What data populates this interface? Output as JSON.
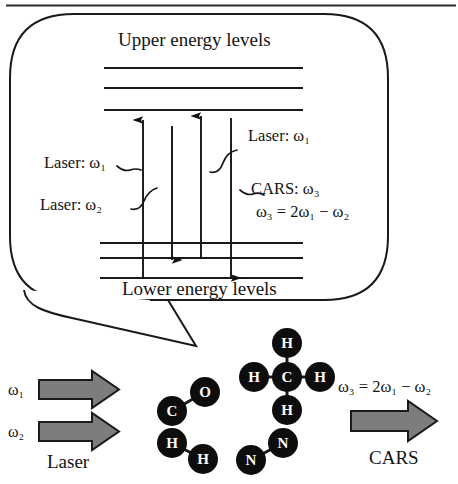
{
  "figure": {
    "bubble": {
      "heading": "Upper energy levels",
      "caption": "Lower energy levels",
      "annotations": {
        "laser_w1_left": "Laser: ω₁",
        "laser_w2_left": "Laser: ω₂",
        "laser_w1_right": "Laser: ω₁",
        "cars_w3_right": "CARS: ω₃",
        "cars_equation": "ω₃ = 2ω₁ − ω₂"
      },
      "upper_levels": [
        68,
        88,
        110
      ],
      "lower_levels": [
        243,
        258,
        278
      ],
      "transitions": [
        {
          "name": "laser-omega1-a",
          "x": 143,
          "direction": "up",
          "from": 278,
          "to": 118,
          "label": "Laser: ω₁"
        },
        {
          "name": "laser-omega2",
          "x": 172,
          "direction": "down",
          "from": 126,
          "to": 262,
          "label": "Laser: ω₂"
        },
        {
          "name": "laser-omega1-b",
          "x": 201,
          "direction": "up",
          "from": 258,
          "to": 114,
          "label": "Laser: ω₁"
        },
        {
          "name": "cars-omega3",
          "x": 231,
          "direction": "down",
          "from": 118,
          "to": 280,
          "label": "CARS: ω₃"
        }
      ]
    },
    "input_beams": {
      "caption": "Laser",
      "beams": [
        {
          "label": "ω₁"
        },
        {
          "label": "ω₂"
        }
      ]
    },
    "output_beam": {
      "caption": "CARS",
      "equation": "ω₃ = 2ω₁ − ω₂"
    },
    "molecules": [
      {
        "name": "carbon-monoxide",
        "formula": "CO",
        "atoms": [
          {
            "label": "C",
            "cx": 172,
            "cy": 411,
            "r": 15
          },
          {
            "label": "O",
            "cx": 205,
            "cy": 392,
            "r": 15
          }
        ],
        "bonds": [
          {
            "from": 0,
            "to": 1
          }
        ]
      },
      {
        "name": "hydrogen",
        "formula": "H2",
        "atoms": [
          {
            "label": "H",
            "cx": 172,
            "cy": 443,
            "r": 15
          },
          {
            "label": "H",
            "cx": 203,
            "cy": 459,
            "r": 15
          }
        ],
        "bonds": [
          {
            "from": 0,
            "to": 1
          }
        ]
      },
      {
        "name": "methane",
        "formula": "CH4",
        "atoms": [
          {
            "label": "C",
            "cx": 287,
            "cy": 377,
            "r": 15
          },
          {
            "label": "H",
            "cx": 287,
            "cy": 343,
            "r": 15
          },
          {
            "label": "H",
            "cx": 254,
            "cy": 377,
            "r": 15
          },
          {
            "label": "H",
            "cx": 320,
            "cy": 377,
            "r": 15
          },
          {
            "label": "H",
            "cx": 287,
            "cy": 410,
            "r": 15
          }
        ],
        "bonds": [
          {
            "from": 0,
            "to": 1
          },
          {
            "from": 0,
            "to": 2
          },
          {
            "from": 0,
            "to": 3
          },
          {
            "from": 0,
            "to": 4
          }
        ]
      },
      {
        "name": "nitrogen",
        "formula": "N2",
        "atoms": [
          {
            "label": "N",
            "cx": 283,
            "cy": 443,
            "r": 15
          },
          {
            "label": "N",
            "cx": 251,
            "cy": 460,
            "r": 15
          }
        ],
        "bonds": [
          {
            "from": 0,
            "to": 1
          }
        ]
      }
    ],
    "colors": {
      "ink": "#141414",
      "arrow_fill": "#7d7d7d",
      "arrow_stroke": "#1a1a1a",
      "atom_fill": "#0d0d0d",
      "atom_text": "#ffffff",
      "background": "#ffffff"
    }
  }
}
